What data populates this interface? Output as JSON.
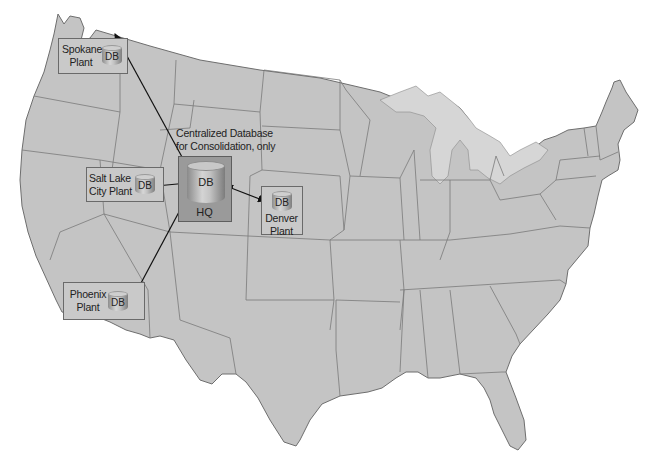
{
  "diagram": {
    "type": "map-network",
    "region": "Contiguous United States",
    "colors": {
      "land": "#c4c4c4",
      "state_borders": "#7a7a7a",
      "great_lakes": "#d6d6d6",
      "plant_box_fill": "#c9c9c9",
      "hq_box_fill": "#9a9a9a",
      "arrow": "#111111"
    },
    "central": {
      "caption_line1": "Centralized Database",
      "caption_line2": "for Consolidation, only",
      "db_label": "DB",
      "location_label": "HQ"
    },
    "plants": [
      {
        "id": "spokane",
        "line1": "Spokane",
        "line2": "Plant",
        "db_label": "DB"
      },
      {
        "id": "salt-lake",
        "line1": "Salt Lake",
        "line2": "City Plant",
        "db_label": "DB"
      },
      {
        "id": "denver",
        "line1": "Denver",
        "line2": "Plant",
        "db_label": "DB"
      },
      {
        "id": "phoenix",
        "line1": "Phoenix",
        "line2": "Plant",
        "db_label": "DB"
      }
    ],
    "connections": [
      {
        "from": "HQ",
        "to": "Spokane Plant",
        "direction": "bidirectional"
      },
      {
        "from": "HQ",
        "to": "Salt Lake City Plant",
        "direction": "bidirectional"
      },
      {
        "from": "HQ",
        "to": "Denver Plant",
        "direction": "bidirectional"
      },
      {
        "from": "HQ",
        "to": "Phoenix Plant",
        "direction": "bidirectional"
      }
    ]
  }
}
